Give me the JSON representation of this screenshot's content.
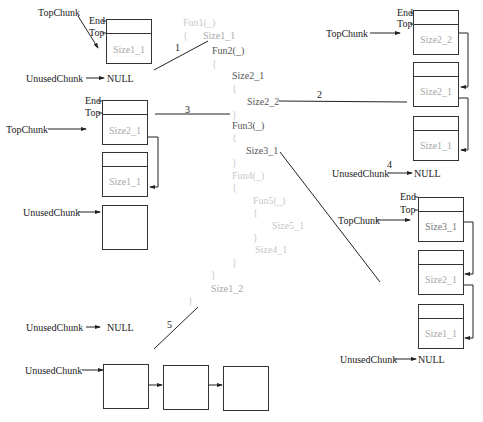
{
  "labels": {
    "top_chunk": "TopChunk",
    "unused_chunk": "UnusedChunk",
    "null": "NULL",
    "end": "End",
    "top": "Top"
  },
  "steps": [
    "1",
    "2",
    "3",
    "4",
    "5"
  ],
  "code": {
    "fun1": "Fun1(_)",
    "brace_open": "{",
    "brace_close": "}",
    "size1_1": "Size1_1",
    "fun2": "Fun2(_)",
    "size2_1": "Size2_1",
    "size2_2": "Size2_2",
    "fun3": "Fun3(_)",
    "size3_1": "Size3_1",
    "fun4": "Fun4(_)",
    "fun5": "Fun5(_)",
    "size5_1": "Size5_1",
    "size4_1": "Size4_1",
    "size1_2": "Size1_2"
  },
  "states": {
    "s1": {
      "chunks": [
        "Size1_1"
      ]
    },
    "s2": {
      "chunks": [
        "Size2_2",
        "Size2_1",
        "Size1_1"
      ]
    },
    "s3": {
      "chunks": [
        "Size2_1",
        "Size1_1"
      ],
      "unused": [
        "empty"
      ]
    },
    "s4": {
      "chunks": [
        "Size3_1",
        "Size2_1",
        "Size1_1"
      ]
    },
    "s5": {
      "unused": [
        "empty",
        "empty",
        "empty"
      ]
    }
  }
}
